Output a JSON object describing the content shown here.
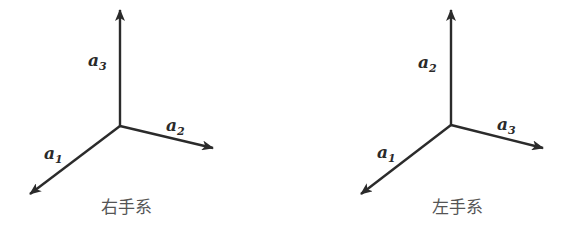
{
  "colors": {
    "axis": "#2b2b2b",
    "label": "#2a2a2a",
    "caption": "#555555",
    "background": "#ffffff"
  },
  "diagrams": [
    {
      "caption": "右手系",
      "origin": [
        120,
        126
      ],
      "vectors": [
        {
          "name": "a",
          "sub": "3",
          "tip": [
            120,
            10
          ],
          "label_pos": [
            88,
            66
          ]
        },
        {
          "name": "a",
          "sub": "2",
          "tip": [
            213,
            148
          ],
          "label_pos": [
            166,
            131
          ]
        },
        {
          "name": "a",
          "sub": "1",
          "tip": [
            30,
            194
          ],
          "label_pos": [
            44,
            159
          ]
        }
      ],
      "caption_pos": [
        126,
        213
      ]
    },
    {
      "caption": "左手系",
      "origin": [
        451,
        125
      ],
      "vectors": [
        {
          "name": "a",
          "sub": "2",
          "tip": [
            451,
            10
          ],
          "label_pos": [
            418,
            68
          ]
        },
        {
          "name": "a",
          "sub": "3",
          "tip": [
            543,
            148
          ],
          "label_pos": [
            497,
            130
          ]
        },
        {
          "name": "a",
          "sub": "1",
          "tip": [
            361,
            194
          ],
          "label_pos": [
            377,
            158
          ]
        }
      ],
      "caption_pos": [
        457,
        213
      ]
    }
  ]
}
